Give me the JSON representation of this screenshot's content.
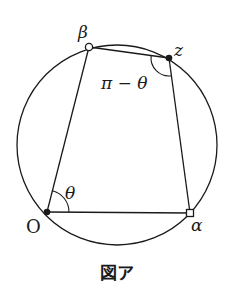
{
  "figure": {
    "caption": "図ア",
    "colors": {
      "stroke": "#1a1a1a",
      "background": "#ffffff"
    },
    "circle": {
      "cx": 117,
      "cy": 145,
      "r": 100
    },
    "points": {
      "O": {
        "label": "O",
        "x": 47,
        "y": 212,
        "marker": "filled-dot"
      },
      "alpha": {
        "label": "α",
        "x": 190,
        "y": 213,
        "marker": "open-square"
      },
      "z": {
        "label": "z",
        "x": 169,
        "y": 58,
        "marker": "filled-dot"
      },
      "beta": {
        "label": "β",
        "x": 89,
        "y": 47,
        "marker": "open-circle"
      }
    },
    "quadrilateral": [
      "O",
      "alpha",
      "z",
      "beta"
    ],
    "angles": {
      "at_O": {
        "label": "θ"
      },
      "at_z": {
        "label": "π − θ"
      }
    }
  }
}
